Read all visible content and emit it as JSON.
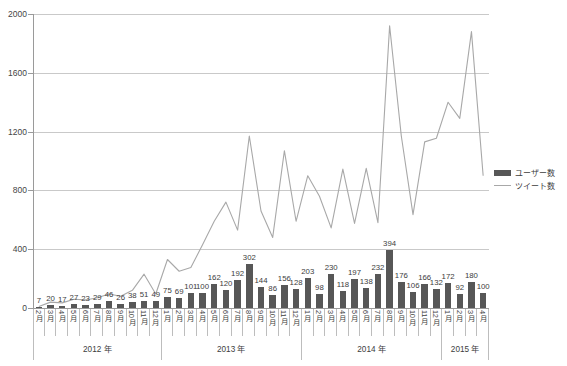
{
  "chart_data": {
    "type": "bar",
    "title": "",
    "xlabel": "",
    "ylabel": "",
    "ylim": [
      0,
      2000
    ],
    "yticks": [
      0,
      400,
      800,
      1200,
      1600,
      2000
    ],
    "grid": true,
    "legend_position": "right",
    "categories": [
      "2月",
      "3月",
      "4月",
      "5月",
      "6月",
      "7月",
      "8月",
      "9月",
      "10月",
      "11月",
      "12月",
      "1月",
      "2月",
      "3月",
      "4月",
      "5月",
      "6月",
      "7月",
      "8月",
      "9月",
      "10月",
      "11月",
      "12月",
      "1月",
      "2月",
      "3月",
      "4月",
      "5月",
      "6月",
      "7月",
      "8月",
      "9月",
      "10月",
      "11月",
      "12月",
      "1月",
      "2月",
      "3月",
      "4月"
    ],
    "year_groups": [
      {
        "label": "2012 年",
        "count": 11
      },
      {
        "label": "2013 年",
        "count": 12
      },
      {
        "label": "2014 年",
        "count": 12
      },
      {
        "label": "2015 年",
        "count": 4
      }
    ],
    "series": [
      {
        "name": "ユーザー数",
        "kind": "bar",
        "color": "#575757",
        "show_labels": true,
        "values": [
          7,
          20,
          17,
          27,
          23,
          29,
          46,
          26,
          38,
          51,
          49,
          75,
          69,
          101,
          100,
          162,
          120,
          192,
          302,
          144,
          86,
          156,
          128,
          203,
          98,
          230,
          118,
          197,
          138,
          232,
          394,
          176,
          106,
          166,
          132,
          172,
          92,
          180,
          100
        ]
      },
      {
        "name": "ツイート数",
        "kind": "line",
        "color": "#a8a8a8",
        "show_labels": false,
        "values": [
          10,
          40,
          35,
          60,
          55,
          70,
          95,
          80,
          120,
          230,
          95,
          330,
          250,
          275,
          430,
          590,
          720,
          530,
          1170,
          660,
          480,
          1070,
          590,
          900,
          760,
          545,
          945,
          575,
          950,
          580,
          1920,
          1170,
          635,
          1130,
          1155,
          1400,
          1290,
          1880,
          900
        ]
      }
    ]
  },
  "legend": {
    "items": [
      {
        "label": "ユーザー数",
        "type": "bar"
      },
      {
        "label": "ツイート数",
        "type": "line"
      }
    ]
  }
}
